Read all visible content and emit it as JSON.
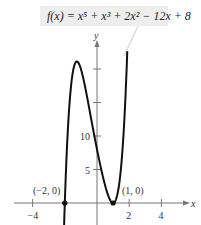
{
  "chart_data": {
    "type": "line",
    "title_display": "f(x) = x⁵ + x³ + 2x² − 12x + 8",
    "xlabel": "x",
    "ylabel": "y",
    "x_ticks": [
      -4,
      -2,
      2,
      4
    ],
    "x_tick_labels": [
      "−4",
      "2",
      "4"
    ],
    "y_ticks": [
      5,
      10,
      15,
      20
    ],
    "y_tick_labels": [
      "5",
      "10"
    ],
    "xlim": [
      -4.3,
      6
    ],
    "ylim": [
      -3.3,
      27
    ],
    "grid": false,
    "series": [
      {
        "name": "f(x)",
        "x": [
          -2.03,
          -2.0,
          -1.9,
          -1.8,
          -1.7,
          -1.6,
          -1.5,
          -1.4,
          -1.3,
          -1.25,
          -1.2,
          -1.0,
          -0.8,
          -0.5,
          0.0,
          0.5,
          0.8,
          1.0,
          1.2,
          1.4,
          1.6,
          1.8,
          1.88
        ],
        "values": [
          -2.2,
          0.0,
          5.6,
          10.2,
          13.9,
          16.8,
          18.9,
          20.3,
          21.0,
          21.1,
          21.0,
          20.0,
          17.7,
          13.9,
          8.0,
          2.7,
          0.61,
          0.0,
          0.73,
          3.14,
          7.59,
          14.51,
          22.65
        ]
      }
    ],
    "annotations": [
      {
        "text": "(−2, 0)",
        "x": -2,
        "y": 0
      },
      {
        "text": "(1, 0)",
        "x": 1,
        "y": 0
      }
    ]
  }
}
